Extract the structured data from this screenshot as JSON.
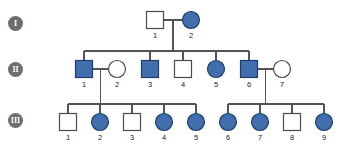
{
  "figure": {
    "type": "pedigree-chart",
    "width": 351,
    "height": 148,
    "background": "#ffffff"
  },
  "colors": {
    "affected_fill": "#416fae",
    "affected_stroke": "#1f3d6b",
    "unaffected_fill": "#ffffff",
    "unaffected_stroke": "#4a4a4a",
    "line": "#555555",
    "badge_fill": "#6e6e6e",
    "badge_text": "#ffffff",
    "label_text": "#222222"
  },
  "generations": [
    {
      "badge": "I",
      "name": "generation-1-badge",
      "x": 8,
      "y": 16
    },
    {
      "badge": "II",
      "name": "generation-2-badge",
      "x": 8,
      "y": 62
    },
    {
      "badge": "III",
      "name": "generation-3-badge",
      "x": 8,
      "y": 113
    }
  ],
  "individuals": [
    {
      "id": "I-1",
      "gen": "I",
      "label": "1",
      "sex": "male",
      "affected": false,
      "cx": 155,
      "cy": 20
    },
    {
      "id": "I-2",
      "gen": "I",
      "label": "2",
      "sex": "female",
      "affected": true,
      "cx": 191,
      "cy": 20
    },
    {
      "id": "II-1",
      "gen": "II",
      "label": "1",
      "sex": "male",
      "affected": true,
      "cx": 84,
      "cy": 69
    },
    {
      "id": "II-2",
      "gen": "II",
      "label": "2",
      "sex": "female",
      "affected": false,
      "cx": 117,
      "cy": 69
    },
    {
      "id": "II-3",
      "gen": "II",
      "label": "3",
      "sex": "male",
      "affected": true,
      "cx": 150,
      "cy": 69
    },
    {
      "id": "II-4",
      "gen": "II",
      "label": "4",
      "sex": "male",
      "affected": false,
      "cx": 183,
      "cy": 69
    },
    {
      "id": "II-5",
      "gen": "II",
      "label": "5",
      "sex": "female",
      "affected": true,
      "cx": 216,
      "cy": 69
    },
    {
      "id": "II-6",
      "gen": "II",
      "label": "6",
      "sex": "male",
      "affected": true,
      "cx": 249,
      "cy": 69
    },
    {
      "id": "II-7",
      "gen": "II",
      "label": "7",
      "sex": "female",
      "affected": false,
      "cx": 282,
      "cy": 69
    },
    {
      "id": "III-1",
      "gen": "III",
      "label": "1",
      "sex": "male",
      "affected": false,
      "cx": 68,
      "cy": 122
    },
    {
      "id": "III-2",
      "gen": "III",
      "label": "2",
      "sex": "female",
      "affected": true,
      "cx": 100,
      "cy": 122
    },
    {
      "id": "III-3",
      "gen": "III",
      "label": "3",
      "sex": "male",
      "affected": false,
      "cx": 132,
      "cy": 122
    },
    {
      "id": "III-4",
      "gen": "III",
      "label": "4",
      "sex": "female",
      "affected": true,
      "cx": 164,
      "cy": 122
    },
    {
      "id": "III-5",
      "gen": "III",
      "label": "5",
      "sex": "female",
      "affected": true,
      "cx": 196,
      "cy": 122
    },
    {
      "id": "III-6",
      "gen": "III",
      "label": "6",
      "sex": "female",
      "affected": true,
      "cx": 228,
      "cy": 122
    },
    {
      "id": "III-7",
      "gen": "III",
      "label": "7",
      "sex": "female",
      "affected": true,
      "cx": 260,
      "cy": 122
    },
    {
      "id": "III-8",
      "gen": "III",
      "label": "8",
      "sex": "male",
      "affected": false,
      "cx": 292,
      "cy": 122
    },
    {
      "id": "III-9",
      "gen": "III",
      "label": "9",
      "sex": "female",
      "affected": true,
      "cx": 324,
      "cy": 122
    }
  ],
  "matings": [
    {
      "name": "mating-I1-I2",
      "partners": [
        "I-1",
        "I-2"
      ],
      "children": [
        "II-1",
        "II-3",
        "II-4",
        "II-5",
        "II-6"
      ]
    },
    {
      "name": "mating-II1-II2",
      "partners": [
        "II-1",
        "II-2"
      ],
      "children": [
        "III-1",
        "III-2",
        "III-3",
        "III-4",
        "III-5"
      ]
    },
    {
      "name": "mating-II6-II7",
      "partners": [
        "II-6",
        "II-7"
      ],
      "children": [
        "III-6",
        "III-7",
        "III-8",
        "III-9"
      ]
    }
  ],
  "symbols": {
    "square_size": 17,
    "circle_radius": 8.5,
    "stroke_width": 1.2
  }
}
